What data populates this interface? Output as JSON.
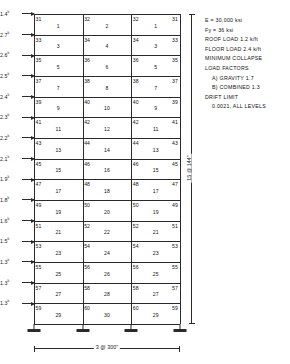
{
  "diagram": {
    "frame": {
      "stories": 15,
      "bays": 3,
      "bay_width_label": "3 @ 300\"",
      "story_height_label": "15 @ 144\"",
      "support_type": "fixed-base"
    },
    "lateral_loads": {
      "unit": "k",
      "values": [
        "1.4",
        "2.7",
        "2.6",
        "2.5",
        "2.4",
        "2.3",
        "2.2",
        "2.1",
        "1.9",
        "1.8",
        "1.6",
        "1.5",
        "1.3",
        "1.3",
        "1.3"
      ]
    },
    "beam_labels": [
      [
        "1",
        "2",
        "1"
      ],
      [
        "3",
        "4",
        "3"
      ],
      [
        "5",
        "6",
        "5"
      ],
      [
        "7",
        "8",
        "7"
      ],
      [
        "9",
        "10",
        "9"
      ],
      [
        "11",
        "12",
        "11"
      ],
      [
        "13",
        "14",
        "13"
      ],
      [
        "15",
        "16",
        "15"
      ],
      [
        "17",
        "18",
        "17"
      ],
      [
        "19",
        "20",
        "19"
      ],
      [
        "21",
        "22",
        "21"
      ],
      [
        "23",
        "24",
        "23"
      ],
      [
        "25",
        "26",
        "25"
      ],
      [
        "27",
        "28",
        "27"
      ],
      [
        "29",
        "30",
        "29"
      ]
    ],
    "column_labels": [
      [
        "31",
        "32",
        "32",
        "31"
      ],
      [
        "33",
        "34",
        "34",
        "33"
      ],
      [
        "35",
        "36",
        "36",
        "35"
      ],
      [
        "37",
        "38",
        "38",
        "37"
      ],
      [
        "39",
        "40",
        "40",
        "39"
      ],
      [
        "41",
        "42",
        "42",
        "41"
      ],
      [
        "43",
        "44",
        "44",
        "43"
      ],
      [
        "45",
        "46",
        "46",
        "45"
      ],
      [
        "47",
        "48",
        "48",
        "47"
      ],
      [
        "49",
        "50",
        "50",
        "49"
      ],
      [
        "51",
        "52",
        "52",
        "51"
      ],
      [
        "53",
        "54",
        "54",
        "53"
      ],
      [
        "55",
        "56",
        "56",
        "55"
      ],
      [
        "57",
        "58",
        "58",
        "57"
      ],
      [
        "59",
        "60",
        "60",
        "59"
      ]
    ],
    "notes": [
      {
        "text": "E = 30,000 ksi",
        "indent": false
      },
      {
        "text": "Fy = 36 ksi",
        "indent": false
      },
      {
        "text": "ROOF LOAD 1.2 k/ft",
        "indent": false
      },
      {
        "text": "FLOOR LOAD 2.4 k/ft",
        "indent": false
      },
      {
        "text": "MINIMUM COLLAPSE",
        "indent": false
      },
      {
        "text": "LOAD FACTORS",
        "indent": false
      },
      {
        "text": "A) GRAVITY 1.7",
        "indent": true
      },
      {
        "text": "B) COMBINED 1.3",
        "indent": true
      },
      {
        "text": "DRIFT LIMIT",
        "indent": false
      },
      {
        "text": "0.0021, ALL LEVELS",
        "indent": true
      }
    ]
  }
}
